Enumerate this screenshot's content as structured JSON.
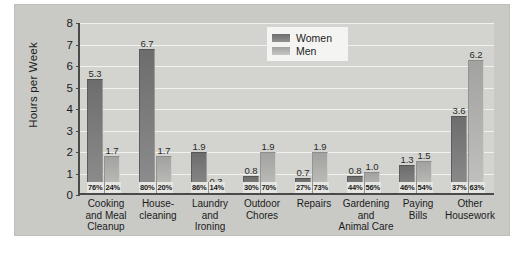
{
  "chart_data": {
    "type": "bar",
    "title": "",
    "xlabel": "",
    "ylabel": "Hours per Week",
    "ylim": [
      0,
      8
    ],
    "yticks": [
      "0",
      "1",
      "2",
      "3",
      "4",
      "5",
      "6",
      "7",
      "8"
    ],
    "grid": true,
    "legend_position": "upper-center-right",
    "categories": [
      "Cooking and Meal Cleanup",
      "House-cleaning",
      "Laundry and Ironing",
      "Outdoor Chores",
      "Repairs",
      "Gardening and Animal Care",
      "Paying Bills",
      "Other Housework"
    ],
    "category_lines": [
      [
        "Cooking",
        "and Meal",
        "Cleanup"
      ],
      [
        "House-",
        "cleaning"
      ],
      [
        "Laundry",
        "and",
        "Ironing"
      ],
      [
        "Outdoor",
        "Chores"
      ],
      [
        "Repairs"
      ],
      [
        "Gardening",
        "and",
        "Animal Care"
      ],
      [
        "Paying",
        "Bills"
      ],
      [
        "Other",
        "Housework"
      ]
    ],
    "series": [
      {
        "name": "Women",
        "color": "#6d6d6d",
        "values": [
          5.3,
          6.7,
          1.9,
          0.8,
          0.7,
          0.8,
          1.3,
          3.6
        ],
        "value_labels": [
          "5.3",
          "6.7",
          "1.9",
          "0.8",
          "0.7",
          "0.8",
          "1.3",
          "3.6"
        ],
        "share_labels": [
          "76%",
          "80%",
          "86%",
          "30%",
          "27%",
          "44%",
          "46%",
          "37%"
        ]
      },
      {
        "name": "Men",
        "color": "#b4b5b1",
        "values": [
          1.7,
          1.7,
          0.3,
          1.9,
          1.9,
          1.0,
          1.5,
          6.2
        ],
        "value_labels": [
          "1.7",
          "1.7",
          "0.3",
          "1.9",
          "1.9",
          "1.0",
          "1.5",
          "6.2"
        ],
        "share_labels": [
          "24%",
          "20%",
          "14%",
          "70%",
          "73%",
          "56%",
          "54%",
          "63%"
        ]
      }
    ]
  },
  "legend": {
    "entries": [
      {
        "label": "Women"
      },
      {
        "label": "Men"
      }
    ]
  }
}
